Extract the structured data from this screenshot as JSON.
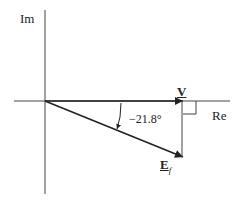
{
  "diagram": {
    "type": "phasor diagram",
    "axes": {
      "imag_label": "Im",
      "real_label": "Re"
    },
    "phasors": [
      {
        "name": "V",
        "label": "V",
        "angle_deg": 0
      },
      {
        "name": "E_f",
        "label": "E",
        "subscript": "f",
        "angle_deg": -21.8
      }
    ],
    "angle_label": "−21.8°",
    "colors": {
      "line": "#222222",
      "background": "#ffffff"
    }
  }
}
